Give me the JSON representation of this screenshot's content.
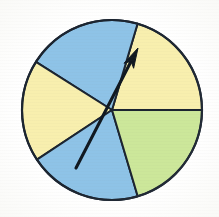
{
  "figure": {
    "name": "spinner-wheel",
    "background_color": "#ffffff"
  },
  "chart_data": {
    "type": "pie",
    "xlabel": "",
    "ylabel": "",
    "grid": false,
    "legend_position": "none",
    "center": {
      "x": 112,
      "y": 110
    },
    "radius": 90,
    "outline_color": "#1b2430",
    "outline_width": 2.2,
    "angle_units": "degrees_ccw_from_east",
    "categories": [
      "Yellow right",
      "Blue top",
      "Yellow left",
      "Blue bottom",
      "Green lower right"
    ],
    "values": [
      73.5,
      74.2,
      65.8,
      73.1,
      73.4
    ],
    "colors": [
      "#f8efae",
      "#8ec3e7",
      "#f8efae",
      "#8ec3e7",
      "#ccE79a"
    ],
    "sectors": [
      {
        "label": "Yellow right",
        "color_name": "yellow",
        "color": "#f8efae",
        "start_angle": 0,
        "end_angle": 73.5,
        "sweep": 73.5
      },
      {
        "label": "Blue top",
        "color_name": "blue",
        "color": "#8ec3e7",
        "start_angle": 73.5,
        "end_angle": 147.7,
        "sweep": 74.2
      },
      {
        "label": "Yellow left",
        "color_name": "yellow",
        "color": "#f8efae",
        "start_angle": 147.7,
        "end_angle": 213.5,
        "sweep": 65.8
      },
      {
        "label": "Blue bottom",
        "color_name": "blue",
        "color": "#8ec3e7",
        "start_angle": 213.5,
        "end_angle": 286.6,
        "sweep": 73.1
      },
      {
        "label": "Green lower right",
        "color_name": "green",
        "color": "#cce79a",
        "start_angle": 286.6,
        "end_angle": 360,
        "sweep": 73.4
      }
    ],
    "pointer": {
      "label": "spinner arrow",
      "color": "#101820",
      "angle": 62.6,
      "tail": {
        "x": 76,
        "y": 168
      },
      "tip": {
        "x": 138,
        "y": 48
      },
      "landing_sector": "Yellow right"
    }
  },
  "palette": {
    "blue": "#8ec3e7",
    "yellow": "#f8efae",
    "green": "#cce79a",
    "ink": "#1b2430",
    "arrow": "#101820"
  }
}
